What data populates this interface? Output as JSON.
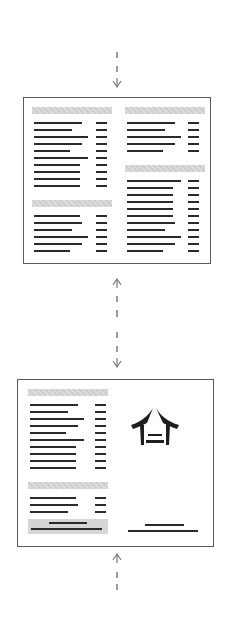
{
  "diagram": {
    "arrows": [
      {
        "id": "top-arrow",
        "direction": "down",
        "style": "dashed"
      },
      {
        "id": "middle-arrow",
        "direction": "both",
        "style": "dashed"
      },
      {
        "id": "bottom-arrow",
        "direction": "up",
        "style": "dashed"
      }
    ],
    "panels": [
      {
        "id": "inside-spread",
        "columns": [
          {
            "sections": [
              {
                "header": true,
                "items": 10
              },
              {
                "header": true,
                "items": 6
              }
            ]
          },
          {
            "sections": [
              {
                "header": true,
                "items": 5
              },
              {
                "header": true,
                "items": 11
              }
            ]
          }
        ]
      },
      {
        "id": "outside-spread",
        "left": {
          "sections": [
            {
              "header": true,
              "items": 10
            },
            {
              "header": true,
              "items": 3
            }
          ],
          "footer_box_lines": 2
        },
        "right": {
          "logo": "pagoda-roof-logo",
          "footer_lines": 2
        }
      }
    ],
    "colors": {
      "line": "#2a2a2a",
      "header_fill": "#d4d4d4",
      "border": "#5a5a5a",
      "arrow": "#777777"
    }
  }
}
